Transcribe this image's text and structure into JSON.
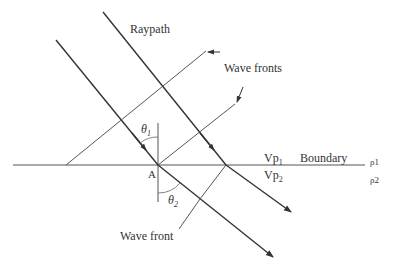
{
  "diagram": {
    "labels": {
      "raypath": "Raypath",
      "wave_fronts": "Wave fronts",
      "wave_front": "Wave front",
      "boundary": "Boundary",
      "point_a": "A",
      "theta1": "θ",
      "theta1_sub": "1",
      "theta2": "θ",
      "theta2_sub": "2",
      "vp1": "Vp",
      "vp1_sub": "1",
      "vp2": "Vp",
      "vp2_sub": "2",
      "rho1": "ρ1",
      "rho2": "ρ2"
    },
    "colors": {
      "line": "#333333",
      "thin_line": "#555555",
      "text": "#333333"
    }
  }
}
